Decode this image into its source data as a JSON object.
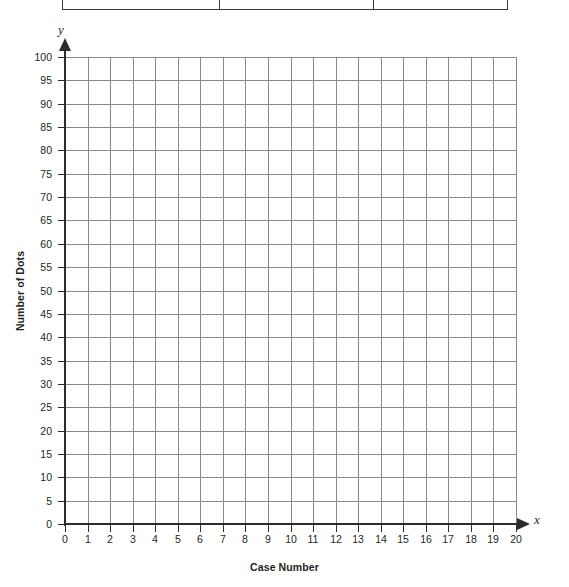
{
  "chart_data": {
    "type": "scatter",
    "title": "",
    "xlabel": "Case Number",
    "ylabel": "Number of Dots",
    "x_axis_letter": "x",
    "y_axis_letter": "y",
    "xlim": [
      0,
      20
    ],
    "ylim": [
      0,
      100
    ],
    "x_tick_step": 1,
    "y_tick_step": 5,
    "x_ticks": [
      "0",
      "1",
      "2",
      "3",
      "4",
      "5",
      "6",
      "7",
      "8",
      "9",
      "10",
      "11",
      "12",
      "13",
      "14",
      "15",
      "16",
      "17",
      "18",
      "19",
      "20"
    ],
    "y_ticks": [
      "0",
      "5",
      "10",
      "15",
      "20",
      "25",
      "30",
      "35",
      "40",
      "45",
      "50",
      "55",
      "60",
      "65",
      "70",
      "75",
      "80",
      "85",
      "90",
      "95",
      "100"
    ],
    "grid": true,
    "legend": null,
    "series": [
      {
        "name": "",
        "x": [],
        "y": []
      }
    ],
    "annotations": [],
    "note": "Empty blank coordinate grid provided for the student to plot points."
  },
  "table": {
    "visible_columns": 3,
    "note": "Only the bottom border and vertical column dividers of a table are visible at the top edge of the image; all cell text is cropped off-screen.",
    "rows": []
  },
  "colors": {
    "grid_line": "#8a8a8a",
    "axis_line": "#2b2b2b",
    "text": "#231f20",
    "background": "#ffffff",
    "table_border": "#3b3b3b"
  }
}
